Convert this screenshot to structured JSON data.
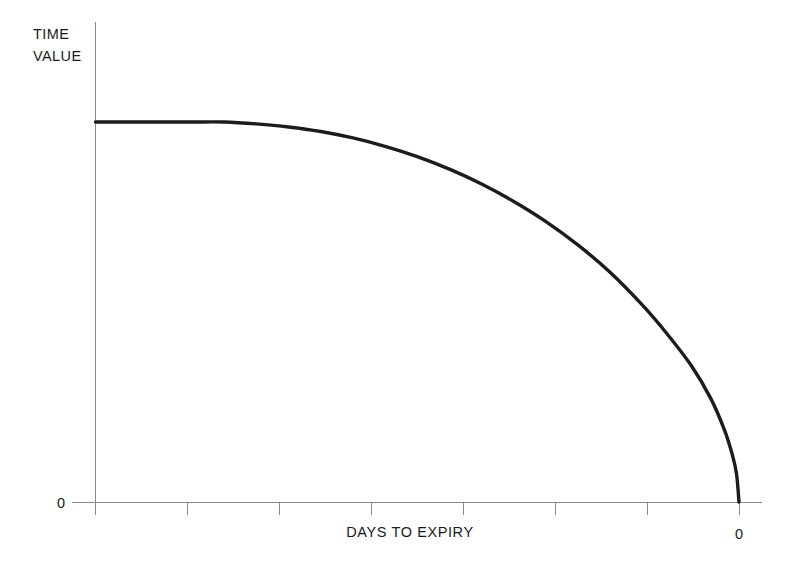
{
  "chart_data": {
    "type": "line",
    "title": "",
    "subtitle": "",
    "ylabel_line1": "TIME",
    "ylabel_line2": "VALUE",
    "xlabel": "DAYS TO EXPIRY",
    "x_tick_labels": [
      "",
      "",
      "",
      "",
      "",
      "",
      "",
      "0"
    ],
    "y_tick_labels": [
      "0"
    ],
    "x_axis_note": "x axis runs from many days to expiry (left) down to 0 days (right)",
    "xlim": [
      8,
      0
    ],
    "ylim": [
      0,
      1.12
    ],
    "grid": false,
    "legend": null,
    "series": [
      {
        "name": "Time value decay",
        "color": "#1c1c1c",
        "x": [
          8.0,
          7.6,
          7.2,
          6.8,
          6.4,
          6.0,
          5.6,
          5.2,
          4.8,
          4.4,
          4.0,
          3.6,
          3.2,
          2.8,
          2.4,
          2.0,
          1.6,
          1.2,
          0.9,
          0.6,
          0.35,
          0.18,
          0.08,
          0.03,
          0.0
        ],
        "y": [
          1.0,
          1.0,
          1.0,
          1.0,
          1.0,
          0.995,
          0.987,
          0.975,
          0.958,
          0.936,
          0.909,
          0.876,
          0.837,
          0.791,
          0.738,
          0.676,
          0.604,
          0.518,
          0.444,
          0.361,
          0.272,
          0.189,
          0.122,
          0.073,
          0.0
        ]
      }
    ]
  },
  "labels": {
    "y_axis_title_line1": "TIME",
    "y_axis_title_line2": "VALUE",
    "y_zero_label": "0",
    "x_axis_title": "DAYS TO EXPIRY",
    "x_zero_label": "0"
  },
  "colors": {
    "curve": "#1c1c1c",
    "axis": "#8a8a8a",
    "background": "#ffffff",
    "text": "#1a1a1a"
  }
}
